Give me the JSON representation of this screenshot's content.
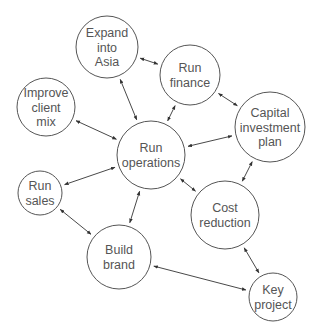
{
  "diagram": {
    "type": "network",
    "colors": {
      "stroke": "#555555",
      "text": "#555555",
      "edge": "#333333",
      "background": "#ffffff"
    },
    "nodes": [
      {
        "id": "expand",
        "lines": [
          "Expand",
          "into",
          "Asia"
        ],
        "cx": 107,
        "cy": 47,
        "r": 31
      },
      {
        "id": "finance",
        "lines": [
          "Run",
          "finance"
        ],
        "cx": 190,
        "cy": 75,
        "r": 30
      },
      {
        "id": "client",
        "lines": [
          "Improve",
          "client",
          "mix"
        ],
        "cx": 46,
        "cy": 107,
        "r": 29
      },
      {
        "id": "operations",
        "lines": [
          "Run",
          "operations"
        ],
        "cx": 151,
        "cy": 155,
        "r": 34
      },
      {
        "id": "capital",
        "lines": [
          "Capital",
          "investment",
          "plan"
        ],
        "cx": 270,
        "cy": 127,
        "r": 35
      },
      {
        "id": "sales",
        "lines": [
          "Run",
          "sales"
        ],
        "cx": 40,
        "cy": 193,
        "r": 22
      },
      {
        "id": "cost",
        "lines": [
          "Cost",
          "reduction"
        ],
        "cx": 225,
        "cy": 215,
        "r": 34
      },
      {
        "id": "brand",
        "lines": [
          "Build",
          "brand"
        ],
        "cx": 119,
        "cy": 257,
        "r": 32
      },
      {
        "id": "key",
        "lines": [
          "Key",
          "project"
        ],
        "cx": 273,
        "cy": 297,
        "r": 24
      }
    ],
    "edges": [
      {
        "from": "expand",
        "to": "finance",
        "bidirectional": true
      },
      {
        "from": "expand",
        "to": "operations",
        "bidirectional": true
      },
      {
        "from": "finance",
        "to": "operations",
        "bidirectional": true
      },
      {
        "from": "finance",
        "to": "capital",
        "bidirectional": true
      },
      {
        "from": "client",
        "to": "operations",
        "bidirectional": true
      },
      {
        "from": "operations",
        "to": "capital",
        "bidirectional": true
      },
      {
        "from": "operations",
        "to": "sales",
        "bidirectional": true
      },
      {
        "from": "operations",
        "to": "cost",
        "bidirectional": true
      },
      {
        "from": "operations",
        "to": "brand",
        "bidirectional": true
      },
      {
        "from": "capital",
        "to": "cost",
        "bidirectional": true
      },
      {
        "from": "sales",
        "to": "brand",
        "bidirectional": true
      },
      {
        "from": "cost",
        "to": "key",
        "bidirectional": true
      },
      {
        "from": "brand",
        "to": "key",
        "bidirectional": true
      }
    ]
  }
}
